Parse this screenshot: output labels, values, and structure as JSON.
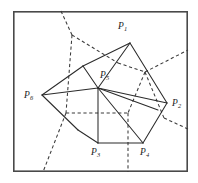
{
  "figure": {
    "type": "geometric-diagram",
    "frame": {
      "x": 13,
      "y": 11,
      "width": 175,
      "height": 161,
      "stroke": "#4a4a4a"
    },
    "colors": {
      "solid_edge": "#2b2b2b",
      "dashed_edge": "#3a3a3a",
      "frame": "#4a4a4a",
      "background": "#ffffff",
      "label": "#1b1b1b"
    },
    "vertices": [
      {
        "id": "P1",
        "base": "P",
        "sub": "1",
        "x": 130,
        "y": 43,
        "label_x": 118,
        "label_y": 22
      },
      {
        "id": "P2",
        "base": "P",
        "sub": "2",
        "x": 167,
        "y": 103,
        "label_x": 172,
        "label_y": 99
      },
      {
        "id": "P3",
        "base": "P",
        "sub": "3",
        "x": 98,
        "y": 143,
        "label_x": 91,
        "label_y": 148
      },
      {
        "id": "P4",
        "base": "P",
        "sub": "4",
        "x": 143,
        "y": 143,
        "label_x": 140,
        "label_y": 148
      },
      {
        "id": "P5",
        "base": "P",
        "sub": "5",
        "x": 98,
        "y": 88,
        "label_x": 100,
        "label_y": 71
      },
      {
        "id": "P6",
        "base": "P",
        "sub": "6",
        "x": 42,
        "y": 95,
        "label_x": 24,
        "label_y": 91
      }
    ],
    "solid_edges": [
      {
        "name": "edge-P6-A",
        "points": "42,95 83,66"
      },
      {
        "name": "edge-A-P1",
        "points": "83,66 130,43"
      },
      {
        "name": "edge-P1-P5",
        "points": "130,43 98,88"
      },
      {
        "name": "edge-P1-P2",
        "points": "130,43 167,103"
      },
      {
        "name": "edge-P5-A",
        "points": "98,88 83,66"
      },
      {
        "name": "edge-P6-P5",
        "points": "42,95 98,88"
      },
      {
        "name": "edge-P6-B",
        "points": "42,95 78,130"
      },
      {
        "name": "edge-B-P3",
        "points": "78,130 98,143"
      },
      {
        "name": "edge-P3-P4",
        "points": "98,143 143,143"
      },
      {
        "name": "edge-P4-P2",
        "points": "143,143 167,103"
      },
      {
        "name": "edge-P5-P3",
        "points": "98,88 98,143"
      },
      {
        "name": "edge-P5-P4",
        "points": "98,88 143,143"
      },
      {
        "name": "edge-P5-P2",
        "points": "98,88 167,103"
      },
      {
        "name": "edge-P5-C",
        "points": "98,88 158,110"
      }
    ],
    "dashed_edges": [
      {
        "name": "bisector-upper-left",
        "points": "61,11 72,35"
      },
      {
        "name": "bisector-upper-right",
        "points": "72,35 118,63"
      },
      {
        "name": "bisector-mid-vertical",
        "points": "72,35 66,113"
      },
      {
        "name": "bisector-node-right",
        "points": "118,63 145,72"
      },
      {
        "name": "bisector-right-out",
        "points": "145,72 188,50"
      },
      {
        "name": "bisector-right-down",
        "points": "145,72 128,113"
      },
      {
        "name": "bisector-right-lower",
        "points": "145,72 164,118"
      },
      {
        "name": "bisector-far-right",
        "points": "164,118 188,129"
      },
      {
        "name": "bisector-horizontal",
        "points": "66,113 128,113"
      },
      {
        "name": "bisector-lower-left",
        "points": "66,113 43,172"
      },
      {
        "name": "bisector-lower-vertical",
        "points": "128,113 128,172"
      }
    ]
  }
}
